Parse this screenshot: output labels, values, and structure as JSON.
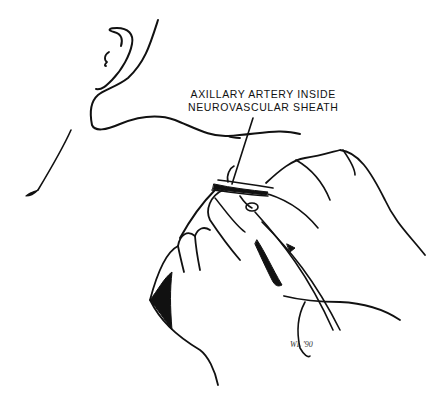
{
  "illustration": {
    "subject": "axillary artery cannulation",
    "label": {
      "line1": "AXILLARY ARTERY INSIDE",
      "line2": "NEUROVASCULAR SHEATH"
    },
    "signature": "WL '90",
    "colors": {
      "ink": "#111111",
      "background": "#ffffff"
    }
  }
}
